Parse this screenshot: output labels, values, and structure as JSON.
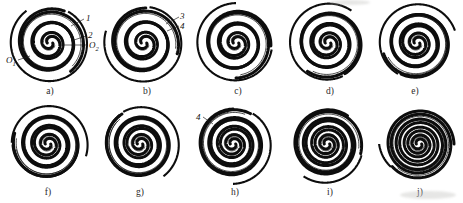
{
  "figure": {
    "panel_count": 10,
    "rows": 2,
    "columns": 5,
    "ink_color": "#0d0d0d",
    "paper_color": "#ffffff",
    "hatch_color": "#8d8d8d"
  },
  "panels": [
    {
      "id": "a",
      "caption": "a)",
      "cx": 50,
      "cy": 43,
      "r": 35,
      "turns": 3.15,
      "open_deg": 300,
      "hatched": true,
      "caption_x": 50,
      "caption_y": 86
    },
    {
      "id": "b",
      "caption": "b)",
      "cx": 144,
      "cy": 43,
      "r": 35,
      "turns": 3.05,
      "open_deg": 285,
      "hatched": true,
      "caption_x": 147,
      "caption_y": 86
    },
    {
      "id": "c",
      "caption": "c)",
      "cx": 236,
      "cy": 43,
      "r": 35,
      "turns": 3.25,
      "open_deg": 265,
      "hatched": true,
      "caption_x": 238,
      "caption_y": 86
    },
    {
      "id": "d",
      "caption": "d)",
      "cx": 328,
      "cy": 43,
      "r": 35,
      "turns": 3.35,
      "open_deg": 245,
      "hatched": true,
      "caption_x": 330,
      "caption_y": 86
    },
    {
      "id": "e",
      "caption": "e)",
      "cx": 417,
      "cy": 43,
      "r": 35,
      "turns": 3.45,
      "open_deg": 225,
      "hatched": false,
      "caption_x": 415,
      "caption_y": 86
    },
    {
      "id": "f",
      "caption": "f)",
      "cx": 48,
      "cy": 144,
      "r": 35,
      "turns": 3.55,
      "open_deg": 200,
      "hatched": false,
      "caption_x": 48,
      "caption_y": 187
    },
    {
      "id": "g",
      "caption": "g)",
      "cx": 140,
      "cy": 144,
      "r": 35,
      "turns": 3.65,
      "open_deg": 175,
      "hatched": false,
      "caption_x": 140,
      "caption_y": 187
    },
    {
      "id": "h",
      "caption": "h)",
      "cx": 233,
      "cy": 144,
      "r": 35,
      "turns": 3.75,
      "open_deg": 150,
      "hatched": false,
      "caption_x": 235,
      "caption_y": 187
    },
    {
      "id": "i",
      "caption": "i)",
      "cx": 327,
      "cy": 144,
      "r": 35,
      "turns": 3.85,
      "open_deg": 110,
      "hatched": false,
      "caption_x": 330,
      "caption_y": 187
    },
    {
      "id": "j",
      "caption": "j)",
      "cx": 419,
      "cy": 144,
      "r": 35,
      "turns": 4.0,
      "open_deg": 40,
      "hatched": false,
      "caption_x": 420,
      "caption_y": 187
    }
  ],
  "callouts": [
    {
      "key": "one",
      "text": "1",
      "sub": "",
      "x": 86,
      "y": 13,
      "lead": {
        "x1": 84,
        "y1": 19,
        "x2": 71,
        "y2": 26
      }
    },
    {
      "key": "two",
      "text": "2",
      "sub": "",
      "x": 88,
      "y": 30,
      "lead": {
        "x1": 86,
        "y1": 36,
        "x2": 74,
        "y2": 40
      }
    },
    {
      "key": "o2",
      "text": "O",
      "sub": "2",
      "x": 89,
      "y": 40,
      "lead": {
        "x1": 88,
        "y1": 45,
        "x2": 62,
        "y2": 45
      }
    },
    {
      "key": "o1",
      "text": "O",
      "sub": "1",
      "x": 6,
      "y": 55,
      "lead": {
        "x1": 18,
        "y1": 60,
        "x2": 30,
        "y2": 56
      }
    },
    {
      "key": "three",
      "text": "3",
      "sub": "",
      "x": 180,
      "y": 11,
      "lead": {
        "x1": 179,
        "y1": 17,
        "x2": 166,
        "y2": 24
      }
    },
    {
      "key": "four",
      "text": "4",
      "sub": "",
      "x": 180,
      "y": 21,
      "lead": {
        "x1": 179,
        "y1": 26,
        "x2": 167,
        "y2": 31
      }
    },
    {
      "key": "four_h",
      "text": "4",
      "sub": "",
      "x": 196,
      "y": 112,
      "lead": {
        "x1": 203,
        "y1": 117,
        "x2": 213,
        "y2": 124
      }
    }
  ]
}
